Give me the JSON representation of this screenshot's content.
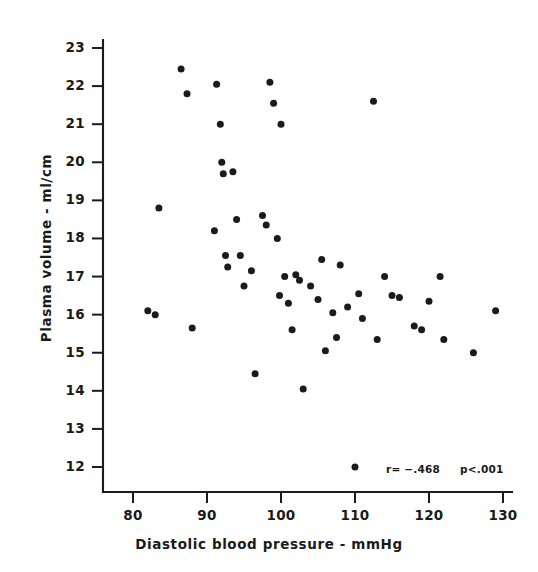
{
  "figure": {
    "kind": "scatter-plot",
    "background_color": "#ffffff",
    "ink_color": "#1b1b1b"
  },
  "annotations": {
    "correlation": "r= −.468",
    "pvalue": "p<.001"
  },
  "chart_data": {
    "type": "scatter",
    "title": "",
    "xlabel": "Diastolic blood pressure - mmHg",
    "ylabel": "Plasma volume - ml/cm",
    "xlim": [
      76,
      130
    ],
    "ylim": [
      11.4,
      23
    ],
    "xticks": [
      80,
      90,
      100,
      110,
      120,
      130
    ],
    "yticks": [
      12,
      13,
      14,
      15,
      16,
      17,
      18,
      19,
      20,
      21,
      22,
      23
    ],
    "xtick_labels": [
      "80",
      "90",
      "100",
      "110",
      "120",
      "130"
    ],
    "ytick_labels": [
      "12",
      "13",
      "14",
      "15",
      "16",
      "17",
      "18",
      "19",
      "20",
      "21",
      "22",
      "23"
    ],
    "grid": false,
    "legend": null,
    "marker": "filled-circle",
    "annotations": [
      "r= −.468",
      "p<.001"
    ],
    "n_points": 55,
    "points": [
      [
        82.0,
        16.1
      ],
      [
        83.0,
        16.0
      ],
      [
        83.5,
        18.8
      ],
      [
        86.5,
        22.45
      ],
      [
        87.3,
        21.8
      ],
      [
        88.0,
        15.65
      ],
      [
        91.0,
        18.2
      ],
      [
        91.3,
        22.05
      ],
      [
        91.8,
        21.0
      ],
      [
        92.0,
        20.0
      ],
      [
        92.2,
        19.7
      ],
      [
        92.5,
        17.55
      ],
      [
        92.8,
        17.25
      ],
      [
        93.5,
        19.75
      ],
      [
        94.0,
        18.5
      ],
      [
        94.5,
        17.55
      ],
      [
        95.0,
        16.75
      ],
      [
        96.0,
        17.15
      ],
      [
        96.5,
        14.45
      ],
      [
        97.5,
        18.6
      ],
      [
        98.0,
        18.35
      ],
      [
        98.5,
        22.1
      ],
      [
        99.0,
        21.55
      ],
      [
        99.5,
        18.0
      ],
      [
        99.8,
        16.5
      ],
      [
        100.0,
        21.0
      ],
      [
        100.5,
        17.0
      ],
      [
        101.0,
        16.3
      ],
      [
        101.5,
        15.6
      ],
      [
        102.0,
        17.05
      ],
      [
        102.5,
        16.9
      ],
      [
        103.0,
        14.05
      ],
      [
        104.0,
        16.75
      ],
      [
        105.0,
        16.4
      ],
      [
        105.5,
        17.45
      ],
      [
        106.0,
        15.05
      ],
      [
        107.0,
        16.05
      ],
      [
        107.5,
        15.4
      ],
      [
        108.0,
        17.3
      ],
      [
        109.0,
        16.2
      ],
      [
        110.0,
        12.0
      ],
      [
        110.5,
        16.55
      ],
      [
        111.0,
        15.9
      ],
      [
        112.5,
        21.6
      ],
      [
        113.0,
        15.35
      ],
      [
        114.0,
        17.0
      ],
      [
        115.0,
        16.5
      ],
      [
        116.0,
        16.45
      ],
      [
        118.0,
        15.7
      ],
      [
        119.0,
        15.6
      ],
      [
        120.0,
        16.35
      ],
      [
        121.5,
        17.0
      ],
      [
        122.0,
        15.35
      ],
      [
        126.0,
        15.0
      ],
      [
        129.0,
        16.1
      ]
    ]
  }
}
